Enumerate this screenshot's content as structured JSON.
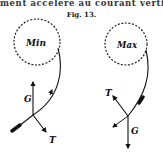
{
  "page": {
    "running_text": "ment accélère au courant vertical",
    "caption": "Fig. 13."
  },
  "figure": {
    "left_panel": {
      "circle_label": "Min",
      "force_labels": {
        "gravity": "G",
        "tension": "T"
      }
    },
    "right_panel": {
      "circle_label": "Max",
      "force_labels": {
        "tension": "T",
        "gravity": "G"
      }
    }
  }
}
